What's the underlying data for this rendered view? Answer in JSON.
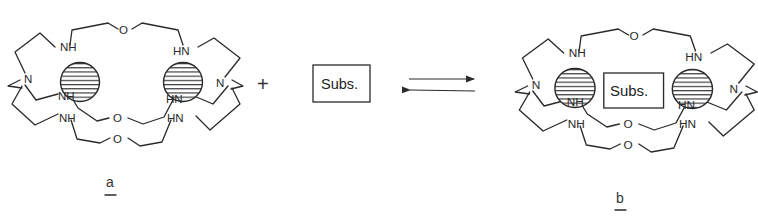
{
  "figure": {
    "type": "reaction-scheme"
  },
  "reactant_a": {
    "label": "a",
    "atoms": {
      "top_oxygen": "O",
      "upper_left_amine": "NH",
      "upper_right_amine": "HN",
      "left_bridgehead": "N",
      "right_bridgehead": "N",
      "middle_left_amine": "NH",
      "middle_right_amine": "HN",
      "lower_left_amine": "NH",
      "lower_right_amine": "HN",
      "middle_oxygen": "O",
      "bottom_oxygen": "O"
    },
    "metal_ions": 2
  },
  "operator": {
    "plus": "+"
  },
  "substrate": {
    "label": "Subs."
  },
  "equilibrium": {
    "forward": "right-arrow",
    "reverse": "left-arrow"
  },
  "product_b": {
    "label": "b",
    "bound_substrate": "Subs.",
    "atoms": {
      "top_oxygen": "O",
      "upper_left_amine": "NH",
      "upper_right_amine": "HN",
      "left_bridgehead": "N",
      "right_bridgehead": "N",
      "middle_left_amine": "NH",
      "middle_right_amine": "HN",
      "lower_left_amine": "NH",
      "lower_right_amine": "HN",
      "middle_oxygen": "O",
      "bottom_oxygen": "O"
    },
    "metal_ions": 2
  },
  "colors": {
    "ink": "#2a2a2a",
    "background": "#ffffff"
  }
}
